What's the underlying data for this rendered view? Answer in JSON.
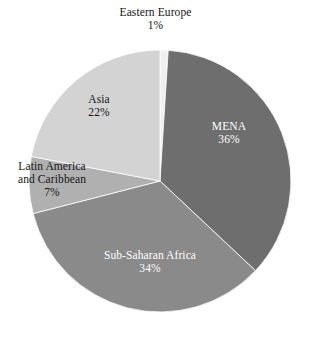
{
  "chart_data": {
    "type": "pie",
    "title": "",
    "subtitle": "",
    "xlabel": "",
    "ylabel": "",
    "legend_position": "none",
    "grid": false,
    "value_unit": "%",
    "start_angle_deg": 0,
    "direction": "clockwise",
    "categories": [
      "Eastern Europe",
      "MENA",
      "Sub-Saharan Africa",
      "Latin America and Caribbean",
      "Asia"
    ],
    "values": [
      1,
      36,
      34,
      7,
      22
    ],
    "slices": [
      {
        "name": "Eastern Europe",
        "label_lines": [
          "Eastern Europe"
        ],
        "value": 1,
        "value_label": "1%",
        "color": "#f0f0f0",
        "label_color": "#151515",
        "label_placement": "outside-top"
      },
      {
        "name": "MENA",
        "label_lines": [
          "MENA"
        ],
        "value": 36,
        "value_label": "36%",
        "color": "#6e6e6e",
        "label_color": "#ffffff",
        "label_placement": "inside"
      },
      {
        "name": "Sub-Saharan Africa",
        "label_lines": [
          "Sub-Saharan Africa"
        ],
        "value": 34,
        "value_label": "34%",
        "color": "#8a8a8a",
        "label_color": "#ffffff",
        "label_placement": "inside"
      },
      {
        "name": "Latin America and Caribbean",
        "label_lines": [
          "Latin America",
          "and Caribbean"
        ],
        "value": 7,
        "value_label": "7%",
        "color": "#b0b0b0",
        "label_color": "#151515",
        "label_placement": "outside-left"
      },
      {
        "name": "Asia",
        "label_lines": [
          "Asia"
        ],
        "value": 22,
        "value_label": "22%",
        "color": "#d3d3d3",
        "label_color": "#151515",
        "label_placement": "inside"
      }
    ],
    "geometry": {
      "center_x": 160,
      "center_y": 181,
      "radius": 131
    },
    "background_color": "#ffffff"
  },
  "labels": {
    "eastern_europe": {
      "name": "Eastern Europe",
      "value": "1%"
    },
    "mena": {
      "name": "MENA",
      "value": "36%"
    },
    "sub_saharan_africa": {
      "name": "Sub-Saharan Africa",
      "value": "34%"
    },
    "latin_america": {
      "line1": "Latin America",
      "line2": "and Caribbean",
      "value": "7%"
    },
    "asia": {
      "name": "Asia",
      "value": "22%"
    }
  }
}
